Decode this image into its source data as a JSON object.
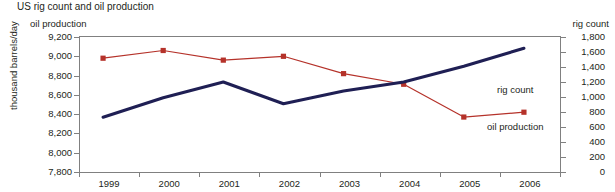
{
  "chart_data": {
    "type": "line",
    "title": "US rig count and oil production",
    "xlabel": "",
    "ylabel": "thousand barrels/day",
    "left_axis_title": "oil production",
    "right_axis_title": "rig count",
    "grid": false,
    "legend_position": "inline-annotations",
    "categories": [
      "1999",
      "2000",
      "2001",
      "2002",
      "2003",
      "2004",
      "2005",
      "2006"
    ],
    "ylim": [
      7800,
      9200
    ],
    "y2lim": [
      0,
      1800
    ],
    "yticks": [
      "7,800",
      "8,000",
      "8,200",
      "8,400",
      "8,600",
      "8,800",
      "9,000",
      "9,200"
    ],
    "y2ticks": [
      "0",
      "200",
      "400",
      "600",
      "800",
      "1,000",
      "1,200",
      "1,400",
      "1,600",
      "1,800"
    ],
    "series": [
      {
        "name": "oil production",
        "axis": "left",
        "color": "#b5322a",
        "marker": "square",
        "annotation": "oil production",
        "values": [
          8980,
          9060,
          8960,
          9000,
          8820,
          8710,
          8370,
          8420
        ]
      },
      {
        "name": "rig count",
        "axis": "right",
        "color": "#1f1f54",
        "marker": "none",
        "annotation": "rig count",
        "values": [
          730,
          990,
          1200,
          910,
          1080,
          1200,
          1410,
          1650
        ]
      }
    ]
  }
}
